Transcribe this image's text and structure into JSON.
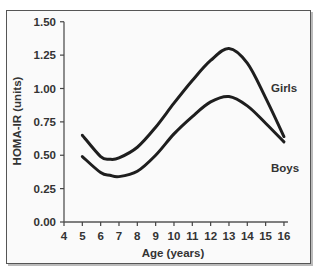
{
  "chart_data": {
    "type": "line",
    "title": "",
    "xlabel": "Age (years)",
    "ylabel": "HOMA-IR (units)",
    "xlim": [
      4,
      16
    ],
    "ylim": [
      0,
      1.5
    ],
    "x_ticks": [
      "4",
      "5",
      "6",
      "7",
      "8",
      "9",
      "10",
      "11",
      "12",
      "13",
      "14",
      "15",
      "16"
    ],
    "y_ticks": [
      "0.00",
      "0.25",
      "0.50",
      "0.75",
      "1.00",
      "1.25",
      "1.50"
    ],
    "grid": false,
    "legend_position": "inline labels at right",
    "x": [
      5,
      6,
      6.5,
      7,
      8,
      9,
      10,
      11,
      12,
      13,
      14,
      15,
      16
    ],
    "series": [
      {
        "name": "Girls",
        "values": [
          0.65,
          0.49,
          0.47,
          0.48,
          0.56,
          0.71,
          0.89,
          1.06,
          1.21,
          1.3,
          1.19,
          0.93,
          0.64
        ]
      },
      {
        "name": "Boys",
        "values": [
          0.49,
          0.37,
          0.35,
          0.34,
          0.38,
          0.5,
          0.66,
          0.79,
          0.9,
          0.94,
          0.87,
          0.74,
          0.6
        ]
      }
    ]
  },
  "labels": {
    "girls": "Girls",
    "boys": "Boys",
    "xlabel": "Age (years)",
    "ylabel": "HOMA-IR (units)"
  }
}
